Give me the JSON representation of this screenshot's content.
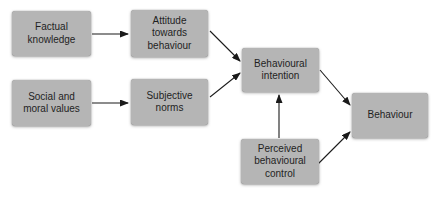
{
  "diagram": {
    "nodes": [
      {
        "id": "factual-knowledge",
        "label": "Factual\nknowledge"
      },
      {
        "id": "social-and-moral-values",
        "label": "Social and\nmoral values"
      },
      {
        "id": "attitude-towards-behaviour",
        "label": "Attitude\ntowards\nbehaviour"
      },
      {
        "id": "subjective-norms",
        "label": "Subjective\nnorms"
      },
      {
        "id": "behavioural-intention",
        "label": "Behavioural\nintention"
      },
      {
        "id": "perceived-behavioural-control",
        "label": "Perceived\nbehavioural\ncontrol"
      },
      {
        "id": "behaviour",
        "label": "Behaviour"
      }
    ],
    "edges": [
      {
        "from": "factual-knowledge",
        "to": "attitude-towards-behaviour"
      },
      {
        "from": "social-and-moral-values",
        "to": "subjective-norms"
      },
      {
        "from": "attitude-towards-behaviour",
        "to": "behavioural-intention"
      },
      {
        "from": "subjective-norms",
        "to": "behavioural-intention"
      },
      {
        "from": "behavioural-intention",
        "to": "behaviour"
      },
      {
        "from": "perceived-behavioural-control",
        "to": "behavioural-intention"
      },
      {
        "from": "perceived-behavioural-control",
        "to": "behaviour"
      }
    ],
    "colors": {
      "box_fill": "#b5b5b5",
      "arrow": "#1a1a1a",
      "text": "#1f1f1f",
      "background": "#ffffff"
    }
  }
}
